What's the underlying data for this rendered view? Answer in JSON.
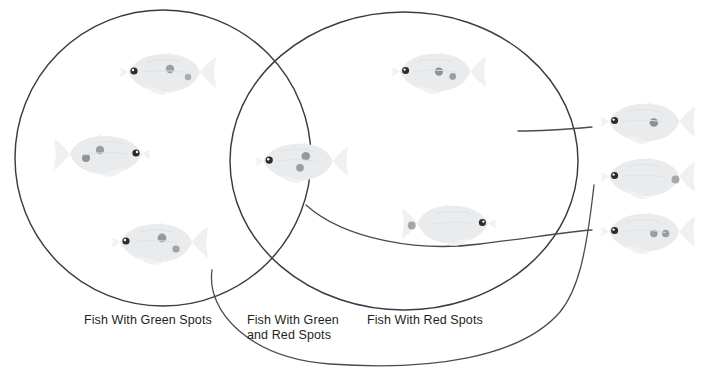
{
  "diagram": {
    "type": "venn-two-set",
    "title_partial_cropped": "",
    "background_color": "#ffffff",
    "outline_color": "#3b3b41",
    "connector_color": "#4a4a50",
    "text_color": "#231f20"
  },
  "labels": {
    "left_set": "Fish With Green Spots",
    "intersection_set": "Fish With Green\nand Red Spots",
    "right_set": "Fish With Red Spots"
  },
  "sets": {
    "left": {
      "name": "Fish With Green Spots",
      "member_count": 3
    },
    "intersection": {
      "name": "Fish With Green and Red Spots",
      "member_count": 1
    },
    "right": {
      "name": "Fish With Red Spots",
      "member_count": 2
    },
    "outside": {
      "name": "Unassigned Fish",
      "member_count": 3
    }
  },
  "fish": [
    {
      "id": "fish-left-top",
      "region": "left",
      "facing": "left",
      "spots": 2,
      "x": 112,
      "y": 46,
      "w": 108,
      "h": 56
    },
    {
      "id": "fish-left-middle",
      "region": "left",
      "facing": "right",
      "spots": 2,
      "x": 50,
      "y": 128,
      "w": 108,
      "h": 56
    },
    {
      "id": "fish-left-bottom",
      "region": "left",
      "facing": "left",
      "spots": 2,
      "x": 104,
      "y": 216,
      "w": 108,
      "h": 56
    },
    {
      "id": "fish-intersection",
      "region": "intersection",
      "facing": "left",
      "spots": 2,
      "x": 248,
      "y": 136,
      "w": 104,
      "h": 54
    },
    {
      "id": "fish-right-top",
      "region": "right",
      "facing": "left",
      "spots": 2,
      "x": 384,
      "y": 46,
      "w": 106,
      "h": 55
    },
    {
      "id": "fish-right-bottom",
      "region": "right",
      "facing": "right",
      "spots": 1,
      "x": 398,
      "y": 198,
      "w": 106,
      "h": 55
    },
    {
      "id": "fish-outside-top",
      "region": "outside",
      "facing": "left",
      "spots": 1,
      "x": 592,
      "y": 96,
      "w": 108,
      "h": 55
    },
    {
      "id": "fish-outside-middle",
      "region": "outside",
      "facing": "left",
      "spots": 1,
      "x": 592,
      "y": 151,
      "w": 108,
      "h": 55
    },
    {
      "id": "fish-outside-bottom",
      "region": "outside",
      "facing": "left",
      "spots": 2,
      "x": 592,
      "y": 206,
      "w": 108,
      "h": 55
    }
  ],
  "connectors": [
    {
      "id": "connector-to-outside-top",
      "from": "right-circle-interior",
      "to": "fish-outside-top"
    },
    {
      "id": "connector-to-outside-middle",
      "from": "left-circle-bottom",
      "to": "fish-outside-middle"
    },
    {
      "id": "connector-to-outside-bottom",
      "from": "intersection-region",
      "to": "fish-outside-bottom"
    }
  ],
  "geometry": {
    "left_circle": {
      "cx": 163,
      "cy": 158,
      "rx": 148,
      "ry": 148
    },
    "right_circle": {
      "cx": 404,
      "cy": 161,
      "rx": 174,
      "ry": 149
    }
  }
}
